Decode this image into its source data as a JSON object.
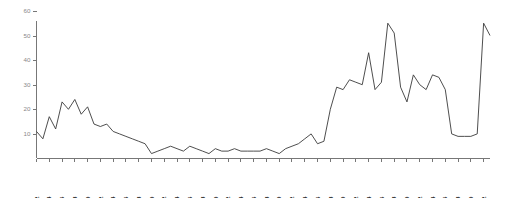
{
  "chart_data": {
    "type": "line",
    "title": "",
    "subtitle": "",
    "xlabel": "",
    "ylabel": "",
    "xlim": [
      1852,
      1923
    ],
    "ylim": [
      0,
      62
    ],
    "grid": false,
    "legend_position": "none",
    "y_ticks": [
      10,
      20,
      30,
      40,
      50,
      60
    ],
    "y_tick_labels": [
      "10",
      "20",
      "30",
      "40",
      "50",
      "60"
    ],
    "x_tick_labels": [
      "1852",
      "1854",
      "1856",
      "1858",
      "1860",
      "1862",
      "1864",
      "1866",
      "1868",
      "1870",
      "1872",
      "1874",
      "1876",
      "1878",
      "1880",
      "1882",
      "1884",
      "1886",
      "1888",
      "1890",
      "1892",
      "1894",
      "1896",
      "1898",
      "1900",
      "1902",
      "1904",
      "1906",
      "1908",
      "1910",
      "1912",
      "1914",
      "1916",
      "1918",
      "1920",
      "1922"
    ],
    "x": [
      1852,
      1853,
      1854,
      1855,
      1856,
      1857,
      1858,
      1859,
      1860,
      1861,
      1862,
      1863,
      1864,
      1865,
      1866,
      1867,
      1868,
      1869,
      1870,
      1871,
      1872,
      1873,
      1874,
      1875,
      1876,
      1877,
      1878,
      1879,
      1880,
      1881,
      1882,
      1883,
      1884,
      1885,
      1886,
      1887,
      1888,
      1889,
      1890,
      1891,
      1892,
      1893,
      1894,
      1895,
      1896,
      1897,
      1898,
      1899,
      1900,
      1901,
      1902,
      1903,
      1904,
      1905,
      1906,
      1907,
      1908,
      1909,
      1910,
      1911,
      1912,
      1913,
      1914,
      1915,
      1916,
      1917,
      1918,
      1919,
      1920,
      1921,
      1922,
      1923
    ],
    "values": [
      11,
      8,
      17,
      12,
      23,
      20,
      24,
      18,
      21,
      14,
      13,
      14,
      11,
      10,
      9,
      8,
      7,
      6,
      2,
      3,
      4,
      5,
      4,
      3,
      5,
      4,
      3,
      2,
      4,
      3,
      3,
      4,
      3,
      3,
      3,
      3,
      4,
      3,
      2,
      4,
      5,
      6,
      8,
      10,
      6,
      7,
      20,
      29,
      28,
      32,
      31,
      30,
      43,
      28,
      31,
      55,
      51,
      29,
      23,
      34,
      30,
      28,
      34,
      33,
      28,
      10,
      9,
      9,
      9,
      10,
      55,
      50
    ],
    "series": [
      {
        "name": "series-1",
        "values": [
          11,
          8,
          17,
          12,
          23,
          20,
          24,
          18,
          21,
          14,
          13,
          14,
          11,
          10,
          9,
          8,
          7,
          6,
          2,
          3,
          4,
          5,
          4,
          3,
          5,
          4,
          3,
          2,
          4,
          3,
          3,
          4,
          3,
          3,
          3,
          3,
          4,
          3,
          2,
          4,
          5,
          6,
          8,
          10,
          6,
          7,
          20,
          29,
          28,
          32,
          31,
          30,
          43,
          28,
          31,
          55,
          51,
          29,
          23,
          34,
          30,
          28,
          34,
          33,
          28,
          10,
          9,
          9,
          9,
          10,
          55,
          50
        ]
      }
    ],
    "colors": {
      "line": "#3a3a3a",
      "axis": "#777777",
      "ytick_text": "#888888",
      "xtick_text": "#2a2a2a",
      "background": "#ffffff"
    }
  }
}
